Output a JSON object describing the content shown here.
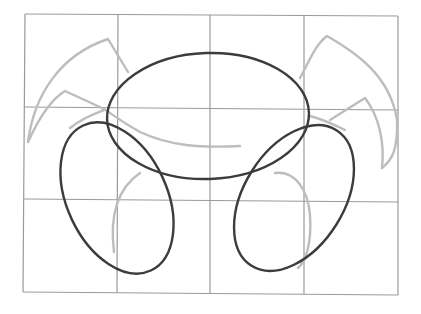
{
  "image": {
    "subject": "pencil sketch of a crab construction drawing on a 4x3 grid",
    "colors": {
      "background": "#ffffff",
      "grid": "#9a9a9a",
      "light_pencil": "#bdbdbd",
      "dark_pencil": "#3c3c3c"
    },
    "grid": {
      "columns": 4,
      "rows": 3
    }
  }
}
